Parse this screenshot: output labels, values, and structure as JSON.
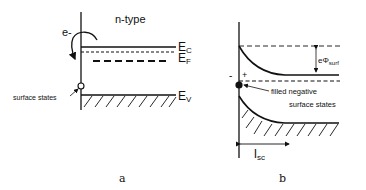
{
  "panel_a": {
    "title": "n-type",
    "electron_label": "e-",
    "surface_states_label": "surface states",
    "ec_label": "E",
    "ec_sub": "C",
    "ef_label": "E",
    "ef_sub": "F",
    "ev_label": "E",
    "ev_sub": "V",
    "caption": "a"
  },
  "panel_b": {
    "minus_sign": "-",
    "plus_sign": "+",
    "barrier_label": "eΦ",
    "barrier_sub": "surf",
    "filled_states_line1": "filled negative",
    "filled_states_line2": "surface states",
    "depletion_label": "l",
    "depletion_sub": "sc",
    "caption": "b"
  },
  "colors": {
    "line": "#111111",
    "background": "#ffffff"
  }
}
